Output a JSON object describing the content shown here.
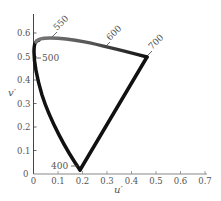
{
  "chart_data": {
    "type": "line",
    "title": "",
    "xlabel": "u′",
    "ylabel": "v′",
    "xlim": [
      0,
      0.7
    ],
    "ylim": [
      0,
      0.65
    ],
    "grid": false,
    "x_ticks": [
      "0",
      "0.1",
      "0.2",
      "0.3",
      "0.4",
      "0.5",
      "0.6",
      "0.7"
    ],
    "y_ticks": [
      "0",
      "0.1",
      "0.2",
      "0.3",
      "0.4",
      "0.5",
      "0.6"
    ],
    "series": [
      {
        "name": "spectral locus (closed gamut)",
        "points": [
          [
            0.19,
            0.016
          ],
          [
            0.165,
            0.06
          ],
          [
            0.135,
            0.115
          ],
          [
            0.1,
            0.19
          ],
          [
            0.07,
            0.275
          ],
          [
            0.045,
            0.37
          ],
          [
            0.01,
            0.5
          ],
          [
            0.005,
            0.55
          ],
          [
            0.02,
            0.58
          ],
          [
            0.06,
            0.585
          ],
          [
            0.1,
            0.583
          ],
          [
            0.2,
            0.563
          ],
          [
            0.3,
            0.545
          ],
          [
            0.462,
            0.5
          ],
          [
            0.19,
            0.016
          ]
        ]
      }
    ],
    "annotations": [
      {
        "label": "400",
        "u": 0.19,
        "v": 0.016
      },
      {
        "label": "500",
        "u": 0.01,
        "v": 0.5
      },
      {
        "label": "550",
        "u": 0.07,
        "v": 0.585
      },
      {
        "label": "600",
        "u": 0.26,
        "v": 0.55
      },
      {
        "label": "700",
        "u": 0.462,
        "v": 0.5
      }
    ]
  }
}
